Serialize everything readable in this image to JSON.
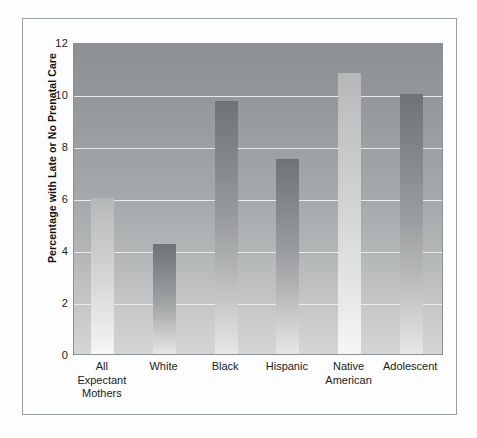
{
  "chart_data": {
    "type": "bar",
    "title": "",
    "xlabel": "",
    "ylabel": "Percentage with Late or No Prenatal Care",
    "ylim": [
      0,
      12
    ],
    "yticks": [
      "0",
      "2",
      "4",
      "6",
      "8",
      "10",
      "12"
    ],
    "grid": true,
    "legend": "none",
    "categories": [
      "All Expectant Mothers",
      "White",
      "Black",
      "Hispanic",
      "Native American",
      "Adolescent"
    ],
    "category_lines": [
      [
        "All",
        "Expectant",
        "Mothers"
      ],
      [
        "White"
      ],
      [
        "Black"
      ],
      [
        "Hispanic"
      ],
      [
        "Native",
        "American"
      ],
      [
        "Adolescent"
      ]
    ],
    "values": [
      6.0,
      4.25,
      9.75,
      7.5,
      10.8,
      10.0
    ],
    "bar_shades": [
      "light",
      "dark",
      "dark",
      "dark",
      "light",
      "dark"
    ]
  },
  "colors": {
    "plot_background_top": "#8c9093",
    "plot_background_bottom": "#d4d6d6",
    "gridline": "#eef0f0",
    "axis": "#8d9194",
    "text": "#1b1b1b",
    "figure_border": "#999da0",
    "bar_dark_top": "#6f7376",
    "bar_light_top": "#b4b7b8"
  }
}
